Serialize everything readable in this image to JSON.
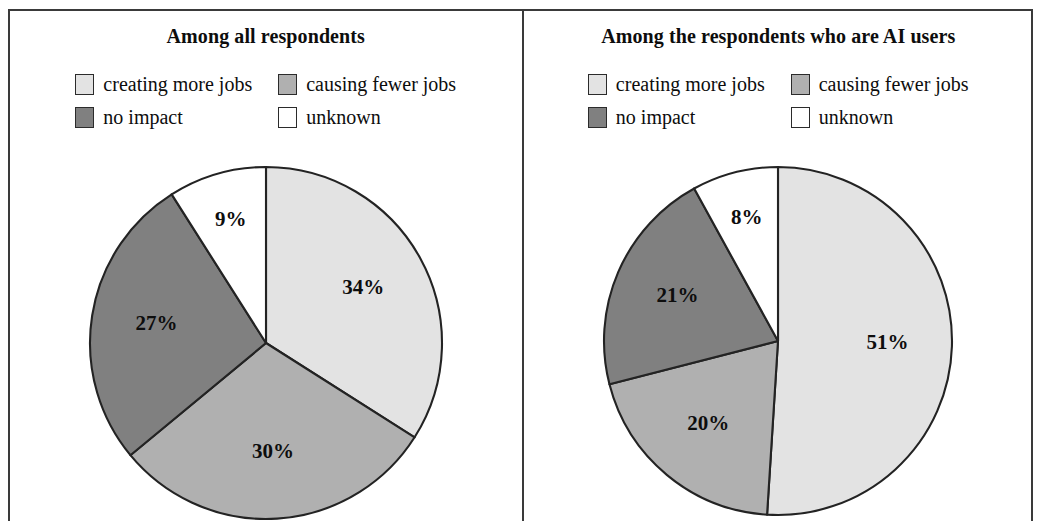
{
  "figure": {
    "border_color": "#3a3a3a",
    "background": "#ffffff"
  },
  "palette": {
    "creating_more_jobs": "#e3e3e3",
    "causing_fewer_jobs": "#b0b0b0",
    "no_impact": "#808080",
    "unknown": "#ffffff",
    "outline": "#232323"
  },
  "legend": {
    "items": [
      {
        "label": "creating more jobs",
        "color": "#e3e3e3"
      },
      {
        "label": "causing fewer jobs",
        "color": "#b0b0b0"
      },
      {
        "label": "no impact",
        "color": "#808080"
      },
      {
        "label": "unknown",
        "color": "#ffffff"
      }
    ]
  },
  "panels": [
    {
      "title": "Among all respondents"
    },
    {
      "title": "Among the respondents who are AI users"
    }
  ],
  "chart_data": [
    {
      "type": "pie",
      "title": "Among all respondents",
      "categories": [
        "creating more jobs",
        "causing fewer jobs",
        "no impact",
        "unknown"
      ],
      "values": [
        34,
        30,
        27,
        9
      ],
      "labels": [
        "34%",
        "30%",
        "27%",
        "9%"
      ],
      "colors": [
        "#e3e3e3",
        "#b0b0b0",
        "#808080",
        "#ffffff"
      ],
      "units": "percent",
      "start_angle_deg": 0,
      "direction": "clockwise",
      "legend_position": "top",
      "grid": false
    },
    {
      "type": "pie",
      "title": "Among the respondents who are AI users",
      "categories": [
        "creating more jobs",
        "causing fewer jobs",
        "no impact",
        "unknown"
      ],
      "values": [
        51,
        20,
        21,
        8
      ],
      "labels": [
        "51%",
        "20%",
        "21%",
        "8%"
      ],
      "colors": [
        "#e3e3e3",
        "#b0b0b0",
        "#808080",
        "#ffffff"
      ],
      "units": "percent",
      "start_angle_deg": 0,
      "direction": "clockwise",
      "legend_position": "top",
      "grid": false
    }
  ]
}
